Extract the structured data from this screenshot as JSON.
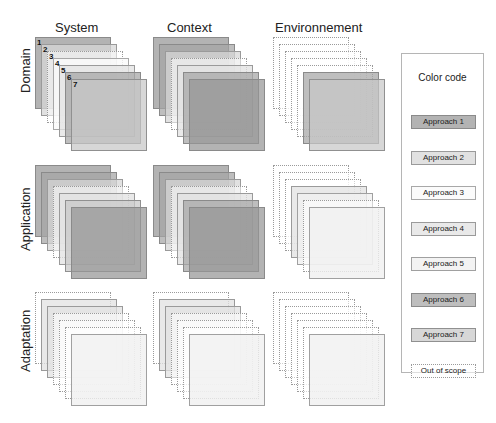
{
  "columns": [
    "System",
    "Context",
    "Environnement"
  ],
  "rows": [
    "Domain",
    "Application",
    "Adaptation"
  ],
  "legend": {
    "title": "Color code",
    "items": [
      {
        "label": "Approach 1",
        "key": "a1"
      },
      {
        "label": "Approach 2",
        "key": "a2"
      },
      {
        "label": "Approach 3",
        "key": "a3"
      },
      {
        "label": "Approach 4",
        "key": "a4"
      },
      {
        "label": "Approach 5",
        "key": "a5"
      },
      {
        "label": "Approach 6",
        "key": "a6"
      },
      {
        "label": "Approach 7",
        "key": "a7"
      },
      {
        "label": "Out of scope",
        "key": "out"
      }
    ]
  },
  "layer_numbers": [
    "1",
    "2",
    "3",
    "4",
    "5",
    "6",
    "7"
  ],
  "grid": [
    [
      [
        "a1",
        "a2",
        "out",
        "a3",
        "a4",
        "a6",
        "a7"
      ],
      [
        "a1",
        "a6",
        "a2",
        "out",
        "a4",
        "a6",
        "a1"
      ],
      [
        "out",
        "out",
        "out",
        "out",
        "out",
        "a6",
        "a7"
      ]
    ],
    [
      [
        "a1",
        "a6",
        "a2",
        "out",
        "a4",
        "a7",
        "a1"
      ],
      [
        "a1",
        "a6",
        "a2",
        "out",
        "a4",
        "a6",
        "a1"
      ],
      [
        "out",
        "out",
        "out",
        "a4",
        "a5",
        "out",
        "a5"
      ]
    ],
    [
      [
        "out",
        "a4",
        "a4",
        "out",
        "out",
        "out",
        "a5"
      ],
      [
        "out",
        "a4",
        "a4",
        "out",
        "out",
        "out",
        "a5"
      ],
      [
        "out",
        "out",
        "out",
        "out",
        "out",
        "out",
        "a5"
      ]
    ]
  ],
  "colors": {
    "a1": "#969696",
    "a2": "#d7d7d7",
    "a3": "#fafafa",
    "a4": "#e1e1e1",
    "a5": "#f0f0f0",
    "a6": "#a5a5a5",
    "a7": "#c8c8c8",
    "out": "#ffffff"
  }
}
